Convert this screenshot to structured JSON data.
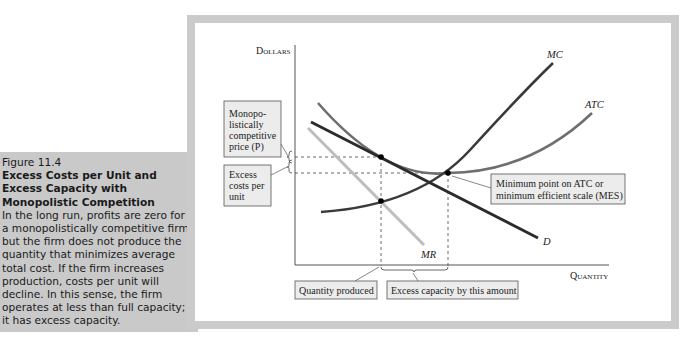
{
  "caption": {
    "figure_number": "Figure 11.4",
    "title_lines": [
      "Excess Costs per Unit and",
      "Excess Capacity with",
      "Monopolistic Competition"
    ],
    "body_lines": [
      "In the long run, profits are zero for",
      "a monopolistically competitive firm,",
      "but the firm does not produce the",
      "quantity that minimizes average",
      "total cost. If the firm increases",
      "production, costs per unit will",
      "decline. In this sense, the firm",
      "operates at less than full capacity;",
      "it has excess capacity."
    ]
  },
  "diagram": {
    "y_axis_label": "Dollars",
    "x_axis_label": "Quantity",
    "curves": {
      "mc": "MC",
      "atc": "ATC",
      "d": "D",
      "mr": "MR"
    },
    "callouts": {
      "price": [
        "Monopo-",
        "listically",
        "competitive",
        "price (P)"
      ],
      "excess_costs": [
        "Excess",
        "costs per",
        "unit"
      ],
      "mes": [
        "Minimum point on ATC or",
        "minimum efficient scale (MES)"
      ],
      "quantity_produced": "Quantity produced",
      "excess_capacity": "Excess capacity by this amount"
    },
    "colors": {
      "frame": "#cbcbcb",
      "caption_bg": "#c9c9c9",
      "d_curve": "#2b2b2b",
      "mc_curve": "#3a3a3a",
      "atc_curve": "#6e6e6e",
      "mr_curve": "#bdbdbd"
    },
    "key_points": [
      {
        "name": "tangency (P, Q produced)",
        "x": 381,
        "y": 157
      },
      {
        "name": "ATC minimum (MES)",
        "x": 448,
        "y": 173
      },
      {
        "name": "MC = MR at Q produced",
        "x": 381,
        "y": 201
      }
    ]
  }
}
